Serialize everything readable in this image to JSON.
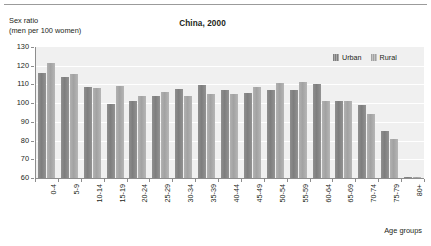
{
  "figure": {
    "title": "China, 2000",
    "y_caption_line1": "Sex ratio",
    "y_caption_line2": "(men per 100 women)",
    "x_axis_title": "Age groups"
  },
  "legend": {
    "position": "top-right",
    "items": [
      {
        "label": "Urban",
        "color": "#898989",
        "name": "urban"
      },
      {
        "label": "Rural",
        "color": "#ababab",
        "name": "rural"
      }
    ]
  },
  "chart_data": {
    "type": "bar",
    "title": "China, 2000",
    "xlabel": "Age groups",
    "ylabel": "Sex ratio (men per 100 women)",
    "ylim": [
      60,
      130
    ],
    "yticks": [
      60,
      70,
      80,
      90,
      100,
      110,
      120,
      130
    ],
    "ytick_labels": [
      "60",
      "70",
      "80",
      "90",
      "100",
      "110",
      "120",
      "130"
    ],
    "grid": true,
    "grid_axis": "y",
    "categories": [
      "0-4",
      "5-9",
      "10-14",
      "15-19",
      "20-24",
      "25-29",
      "30-34",
      "35-39",
      "40-44",
      "45-49",
      "50-54",
      "55-59",
      "60-64",
      "65-69",
      "70-74",
      "75-79",
      "80+"
    ],
    "series": [
      {
        "name": "Urban",
        "color": "#898989",
        "values": [
          116.2,
          113.8,
          108.9,
          99.6,
          101.1,
          103.6,
          107.3,
          109.5,
          106.9,
          105.4,
          106.9,
          107.0,
          110.4,
          101.4,
          99.0,
          85.2,
          60.8
        ]
      },
      {
        "name": "Rural",
        "color": "#ababab",
        "values": [
          121.3,
          115.4,
          108.3,
          109.3,
          104.0,
          105.7,
          104.0,
          105.0,
          105.0,
          108.6,
          110.8,
          111.1,
          101.4,
          101.4,
          94.4,
          80.6,
          60.4
        ]
      }
    ]
  }
}
